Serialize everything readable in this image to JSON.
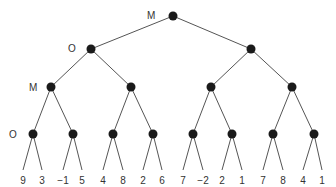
{
  "diagram": {
    "type": "game-tree",
    "level_labels": [
      {
        "level": 0,
        "label": "M"
      },
      {
        "level": 1,
        "label": "O"
      },
      {
        "level": 2,
        "label": "M"
      },
      {
        "level": 3,
        "label": "O"
      }
    ],
    "nodes": {
      "root": {
        "x": 173,
        "y": 16
      },
      "level1": [
        {
          "x": 91,
          "y": 49
        },
        {
          "x": 251,
          "y": 49
        }
      ],
      "level2": [
        {
          "x": 51,
          "y": 87
        },
        {
          "x": 131,
          "y": 87
        },
        {
          "x": 211,
          "y": 87
        },
        {
          "x": 292,
          "y": 87
        }
      ],
      "level3": [
        {
          "x": 33,
          "y": 134
        },
        {
          "x": 73,
          "y": 134
        },
        {
          "x": 113,
          "y": 134
        },
        {
          "x": 153,
          "y": 134
        },
        {
          "x": 193,
          "y": 134
        },
        {
          "x": 232,
          "y": 134
        },
        {
          "x": 273,
          "y": 134
        },
        {
          "x": 314,
          "y": 134
        }
      ]
    },
    "leaves": [
      {
        "x": 23,
        "value": "9"
      },
      {
        "x": 42,
        "value": "3"
      },
      {
        "x": 63,
        "value": "−1"
      },
      {
        "x": 82,
        "value": "5"
      },
      {
        "x": 103,
        "value": "4"
      },
      {
        "x": 123,
        "value": "8"
      },
      {
        "x": 143,
        "value": "2"
      },
      {
        "x": 162,
        "value": "6"
      },
      {
        "x": 183,
        "value": "7"
      },
      {
        "x": 203,
        "value": "−2"
      },
      {
        "x": 222,
        "value": "2"
      },
      {
        "x": 242,
        "value": "1"
      },
      {
        "x": 263,
        "value": "7"
      },
      {
        "x": 283,
        "value": "8"
      },
      {
        "x": 303,
        "value": "4"
      },
      {
        "x": 322,
        "value": "1"
      }
    ]
  }
}
